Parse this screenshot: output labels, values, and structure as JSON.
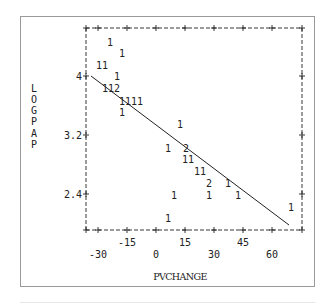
{
  "chart_data": {
    "type": "scatter",
    "title": "",
    "xlabel": "PVCHANGE",
    "ylabel": "LOGPAP",
    "xlim": [
      -34,
      67
    ],
    "ylim": [
      2.04,
      4.51
    ],
    "x_ticks": [
      -30,
      -15,
      0,
      15,
      30,
      45,
      60
    ],
    "x_tick_labels_row1": [
      "-15",
      "15",
      "45"
    ],
    "x_tick_labels_row2": [
      "-30",
      "0",
      "30",
      "60"
    ],
    "y_ticks": [
      4,
      3.2,
      2.4
    ],
    "y_tick_labels": [
      "4",
      "3.2",
      "2.4"
    ],
    "grid": false,
    "legend": null,
    "plot_symbol_note": "Counts of observations per character cell (1 = one obs, 2 = two obs)",
    "points": [
      {
        "x": -22,
        "y": 4.35,
        "symbol": "1"
      },
      {
        "x": -16,
        "y": 4.24,
        "symbol": "1"
      },
      {
        "x": -26,
        "y": 4.12,
        "symbol": "11"
      },
      {
        "x": -19,
        "y": 4.0,
        "symbol": "1"
      },
      {
        "x": -22,
        "y": 3.88,
        "symbol": "112"
      },
      {
        "x": -12,
        "y": 3.76,
        "symbol": "1111"
      },
      {
        "x": -16,
        "y": 3.64,
        "symbol": "1"
      },
      {
        "x": 12,
        "y": 3.52,
        "symbol": "1"
      },
      {
        "x": 6,
        "y": 3.27,
        "symbol": "1"
      },
      {
        "x": 15,
        "y": 3.27,
        "symbol": "2"
      },
      {
        "x": 16,
        "y": 3.15,
        "symbol": "11"
      },
      {
        "x": 22,
        "y": 3.03,
        "symbol": "11"
      },
      {
        "x": 27,
        "y": 2.91,
        "symbol": "2"
      },
      {
        "x": 37,
        "y": 2.91,
        "symbol": "1"
      },
      {
        "x": 9,
        "y": 2.79,
        "symbol": "1"
      },
      {
        "x": 27,
        "y": 2.79,
        "symbol": "1"
      },
      {
        "x": 42,
        "y": 2.79,
        "symbol": "1"
      },
      {
        "x": 69,
        "y": 2.67,
        "symbol": "1"
      },
      {
        "x": 6,
        "y": 2.55,
        "symbol": "1"
      }
    ],
    "regression_line": {
      "x0": -33,
      "y0": 4.0,
      "x1": 65,
      "y1": 2.48
    }
  },
  "axes": {
    "y_axis_title_letters": [
      "L",
      "O",
      "G",
      "P",
      "A",
      "P"
    ],
    "x_axis_title": "PVCHANGE"
  },
  "colors": {
    "ink": "#222222",
    "frame": "#9a9a9a",
    "background": "#ffffff"
  }
}
